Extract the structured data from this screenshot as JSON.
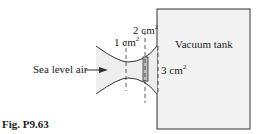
{
  "diagram": {
    "inlet_label": "Sea level air",
    "throat_area": {
      "value": "1 cm",
      "exp": "2"
    },
    "shock_area": {
      "value": "2 cm",
      "exp": "2"
    },
    "exit_area": {
      "value": "3 cm",
      "exp": "2"
    },
    "tank_label": "Vacuum tank",
    "caption": "Fig. P9.63"
  },
  "colors": {
    "fluid_fill": "#eeeeee",
    "tank_fill": "#f2f2f2",
    "shock_fill": "#bdbdbd",
    "line": "#333333"
  }
}
